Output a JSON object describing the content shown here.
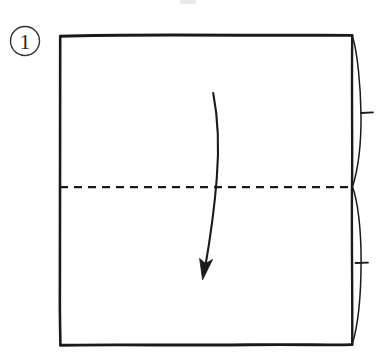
{
  "figure": {
    "kind": "origami-instruction-diagram",
    "step_label": "1",
    "caption": "",
    "background_color": "#ffffff",
    "ink_color": "#1a1a1a"
  },
  "step_marker": {
    "name": "circled-step-number",
    "label": "1",
    "shape": "circle",
    "center_x": 25,
    "center_y": 41,
    "radius": 15
  },
  "paper": {
    "name": "paper-square",
    "left": 60,
    "top": 35,
    "right": 352,
    "bottom": 345,
    "width": 292,
    "height": 310,
    "edge_color": "#1a1a1a",
    "edge_width": 2.6
  },
  "crease_line": {
    "name": "horizontal-crease",
    "type": "valley-fold-dashed",
    "y": 187,
    "x_start": 60,
    "x_end": 354,
    "dash_length": 8,
    "dash_gap": 6,
    "color": "#1a1a1a",
    "width": 2.1
  },
  "fold_arrow": {
    "name": "fold-direction-arrow",
    "direction": "downward",
    "start_x": 213,
    "start_y": 93,
    "end_x": 203,
    "end_y": 277,
    "curve_bulge": "slight-right-then-left",
    "head_style": "solid-filled",
    "color": "#1a1a1a",
    "width": 2.1
  },
  "right_bulges": [
    {
      "name": "upper-paper-bulge",
      "from_y": 35,
      "to_y": 187,
      "max_x": 361,
      "color": "#1a1a1a"
    },
    {
      "name": "lower-paper-bulge",
      "from_y": 187,
      "to_y": 345,
      "max_x": 361,
      "color": "#1a1a1a"
    }
  ],
  "tick_marks": [
    {
      "name": "upper-edge-tick",
      "x_start": 361,
      "x_end": 373,
      "y": 113,
      "color": "#1a1a1a"
    },
    {
      "name": "lower-edge-tick",
      "x_start": 356,
      "x_end": 368,
      "y": 263,
      "color": "#1a1a1a"
    }
  ],
  "artifacts": [
    {
      "name": "top-crop-smudge",
      "x": 180,
      "y": 0,
      "width": 16,
      "height": 4,
      "color": "#e8e8e8"
    }
  ]
}
